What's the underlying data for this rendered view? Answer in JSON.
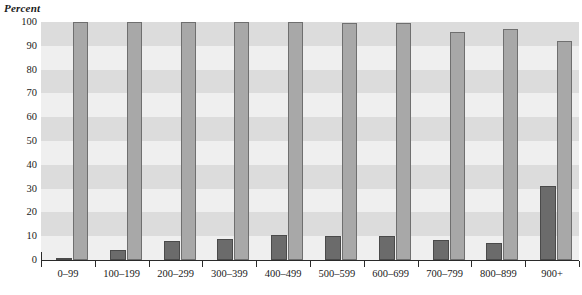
{
  "chart_data": {
    "type": "bar",
    "title": "",
    "subtitle": "",
    "xlabel": "",
    "ylabel": "Percent",
    "ylim": [
      0,
      100
    ],
    "ytick_step": 10,
    "yticks": [
      0,
      10,
      20,
      30,
      40,
      50,
      60,
      70,
      80,
      90,
      100
    ],
    "ytick_labels": [
      "0",
      "10",
      "20",
      "30",
      "40",
      "50",
      "60",
      "70",
      "80",
      "90",
      "100"
    ],
    "grid": "horizontal-alternating-bands",
    "legend": "none",
    "legend_position": "none",
    "orientation": "vertical",
    "grouping": "grouped",
    "categories": [
      "0–99",
      "100–199",
      "200–299",
      "300–399",
      "400–499",
      "500–599",
      "600–699",
      "700–799",
      "800–899",
      "900+"
    ],
    "series": [
      {
        "name": "series-a",
        "color": "#6b6b6b",
        "values": [
          1,
          4,
          8,
          9,
          10.5,
          10,
          10,
          8.5,
          7,
          31
        ]
      },
      {
        "name": "series-b",
        "color": "#a8a8a8",
        "values": [
          100,
          100,
          100,
          100,
          100,
          99.5,
          99.5,
          96,
          97,
          92
        ]
      }
    ],
    "annotations": []
  },
  "style": {
    "band_light": "#efefef",
    "band_dark": "#dcdcdc",
    "axis_color": "#2a2a2a",
    "text_color": "#1a1a1a",
    "plot_background": "#efefef"
  }
}
